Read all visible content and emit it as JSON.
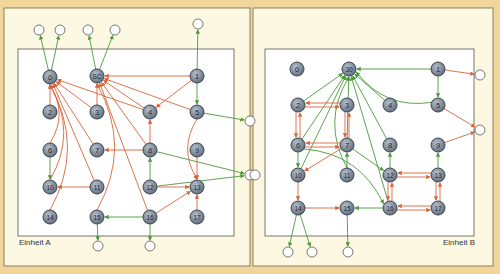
{
  "colors": {
    "background": "#f2d59a",
    "panel": "#fdf8e1",
    "inner": "#ffffff",
    "node_fill": "#7f8c99",
    "node_stroke": "#3c4654",
    "red_edge": "#d9643a",
    "green_edge": "#4b9a3c"
  },
  "panels": [
    {
      "id": "A",
      "label": "Einheit A",
      "outer": [
        4,
        8,
        246,
        258
      ],
      "inner": [
        18,
        49,
        216,
        187
      ],
      "label_pos": [
        19,
        243
      ],
      "nodes": [
        {
          "id": "0",
          "x": 50,
          "y": 77
        },
        {
          "id": "SC",
          "x": 97,
          "y": 76
        },
        {
          "id": "1",
          "x": 197,
          "y": 76
        },
        {
          "id": "2",
          "x": 50,
          "y": 112
        },
        {
          "id": "3",
          "x": 97,
          "y": 112
        },
        {
          "id": "4",
          "x": 150,
          "y": 112
        },
        {
          "id": "5",
          "x": 197,
          "y": 112
        },
        {
          "id": "6",
          "x": 50,
          "y": 150
        },
        {
          "id": "7",
          "x": 97,
          "y": 150
        },
        {
          "id": "8",
          "x": 150,
          "y": 150
        },
        {
          "id": "9",
          "x": 197,
          "y": 150
        },
        {
          "id": "10",
          "x": 50,
          "y": 187
        },
        {
          "id": "11",
          "x": 97,
          "y": 187
        },
        {
          "id": "12",
          "x": 150,
          "y": 187
        },
        {
          "id": "13",
          "x": 197,
          "y": 187
        },
        {
          "id": "14",
          "x": 50,
          "y": 217
        },
        {
          "id": "15",
          "x": 97,
          "y": 217
        },
        {
          "id": "16",
          "x": 150,
          "y": 217
        },
        {
          "id": "17",
          "x": 197,
          "y": 217
        }
      ],
      "externals": [
        {
          "id": "eA1",
          "x": 39,
          "y": 30
        },
        {
          "id": "eA2",
          "x": 60,
          "y": 30
        },
        {
          "id": "eA3",
          "x": 88,
          "y": 30
        },
        {
          "id": "eA4",
          "x": 115,
          "y": 30
        },
        {
          "id": "eA5",
          "x": 198,
          "y": 24
        },
        {
          "id": "eA6",
          "x": 250,
          "y": 121
        },
        {
          "id": "eA7",
          "x": 250,
          "y": 175
        },
        {
          "id": "eA8",
          "x": 98,
          "y": 246
        },
        {
          "id": "eA9",
          "x": 150,
          "y": 246
        }
      ],
      "edges": [
        {
          "from": "0",
          "to": "eA1",
          "color": "green"
        },
        {
          "from": "0",
          "to": "eA2",
          "color": "green"
        },
        {
          "from": "SC",
          "to": "eA3",
          "color": "green"
        },
        {
          "from": "SC",
          "to": "eA4",
          "color": "green"
        },
        {
          "from": "1",
          "to": "eA5",
          "color": "green"
        },
        {
          "from": "1",
          "to": "5",
          "color": "green"
        },
        {
          "from": "5",
          "to": "eA6",
          "color": "green"
        },
        {
          "from": "8",
          "to": "eA7",
          "color": "green"
        },
        {
          "from": "12",
          "to": "eA7",
          "color": "green"
        },
        {
          "from": "12",
          "to": "8",
          "color": "green"
        },
        {
          "from": "6",
          "to": "10",
          "color": "green"
        },
        {
          "from": "16",
          "to": "15",
          "color": "green"
        },
        {
          "from": "15",
          "to": "eA8",
          "color": "green"
        },
        {
          "from": "16",
          "to": "eA9",
          "color": "green"
        },
        {
          "from": "1",
          "to": "SC",
          "color": "red"
        },
        {
          "from": "1",
          "to": "4",
          "color": "red"
        },
        {
          "from": "2",
          "to": "0",
          "color": "red"
        },
        {
          "from": "3",
          "to": "0",
          "color": "red"
        },
        {
          "from": "3",
          "to": "SC",
          "color": "red"
        },
        {
          "from": "4",
          "to": "0",
          "color": "red"
        },
        {
          "from": "4",
          "to": "SC",
          "color": "red"
        },
        {
          "from": "5",
          "to": "SC",
          "color": "red"
        },
        {
          "from": "7",
          "to": "0",
          "color": "red"
        },
        {
          "from": "11",
          "to": "0",
          "color": "red"
        },
        {
          "from": "10",
          "to": "0",
          "color": "red",
          "curve": true
        },
        {
          "from": "14",
          "to": "0",
          "color": "red",
          "curve": true
        },
        {
          "from": "6",
          "to": "0",
          "color": "red",
          "curve": true
        },
        {
          "from": "15",
          "to": "SC",
          "color": "red",
          "curve": true
        },
        {
          "from": "16",
          "to": "SC",
          "color": "red"
        },
        {
          "from": "8",
          "to": "SC",
          "color": "red"
        },
        {
          "from": "8",
          "to": "7",
          "color": "red"
        },
        {
          "from": "8",
          "to": "4",
          "color": "red"
        },
        {
          "from": "11",
          "to": "10",
          "color": "red"
        },
        {
          "from": "9",
          "to": "13",
          "color": "red"
        },
        {
          "from": "12",
          "to": "13",
          "color": "red"
        },
        {
          "from": "16",
          "to": "13",
          "color": "red"
        },
        {
          "from": "17",
          "to": "13",
          "color": "red"
        },
        {
          "from": "5",
          "to": "13",
          "color": "red",
          "curve": true
        }
      ]
    },
    {
      "id": "B",
      "label": "Einheit B",
      "outer": [
        253,
        8,
        240,
        258
      ],
      "inner": [
        265,
        49,
        209,
        187
      ],
      "label_pos": [
        443,
        243
      ],
      "nodes": [
        {
          "id": "0",
          "x": 297,
          "y": 69
        },
        {
          "id": "30",
          "x": 349,
          "y": 69
        },
        {
          "id": "1",
          "x": 438,
          "y": 69
        },
        {
          "id": "2",
          "x": 298,
          "y": 105
        },
        {
          "id": "3",
          "x": 347,
          "y": 105
        },
        {
          "id": "4",
          "x": 390,
          "y": 105
        },
        {
          "id": "5",
          "x": 438,
          "y": 105
        },
        {
          "id": "6",
          "x": 298,
          "y": 145
        },
        {
          "id": "7",
          "x": 347,
          "y": 145
        },
        {
          "id": "8",
          "x": 390,
          "y": 145
        },
        {
          "id": "9",
          "x": 438,
          "y": 145
        },
        {
          "id": "10",
          "x": 298,
          "y": 175
        },
        {
          "id": "11",
          "x": 347,
          "y": 175
        },
        {
          "id": "12",
          "x": 390,
          "y": 175
        },
        {
          "id": "13",
          "x": 438,
          "y": 175
        },
        {
          "id": "14",
          "x": 298,
          "y": 208
        },
        {
          "id": "15",
          "x": 347,
          "y": 208
        },
        {
          "id": "16",
          "x": 390,
          "y": 208
        },
        {
          "id": "17",
          "x": 438,
          "y": 208
        }
      ],
      "externals": [
        {
          "id": "eB1",
          "x": 480,
          "y": 75
        },
        {
          "id": "eB2",
          "x": 480,
          "y": 130
        },
        {
          "id": "eB3",
          "x": 255,
          "y": 175
        },
        {
          "id": "eB4",
          "x": 288,
          "y": 252
        },
        {
          "id": "eB5",
          "x": 312,
          "y": 252
        },
        {
          "id": "eB6",
          "x": 348,
          "y": 252
        }
      ],
      "edges": [
        {
          "from": "1",
          "to": "30",
          "color": "green"
        },
        {
          "from": "1",
          "to": "5",
          "color": "green"
        },
        {
          "from": "5",
          "to": "30",
          "color": "green",
          "curve": true
        },
        {
          "from": "2",
          "to": "30",
          "color": "green"
        },
        {
          "from": "4",
          "to": "30",
          "color": "green"
        },
        {
          "from": "8",
          "to": "30",
          "color": "green"
        },
        {
          "from": "6",
          "to": "30",
          "color": "green"
        },
        {
          "from": "10",
          "to": "30",
          "color": "green"
        },
        {
          "from": "7",
          "to": "30",
          "color": "green"
        },
        {
          "from": "11",
          "to": "30",
          "color": "green",
          "curve": true
        },
        {
          "from": "16",
          "to": "30",
          "color": "green"
        },
        {
          "from": "11",
          "to": "7",
          "color": "green"
        },
        {
          "from": "7",
          "to": "12",
          "color": "green"
        },
        {
          "from": "6",
          "to": "10",
          "color": "green"
        },
        {
          "from": "6",
          "to": "16",
          "color": "green",
          "curve": true
        },
        {
          "from": "12",
          "to": "8",
          "color": "green"
        },
        {
          "from": "13",
          "to": "9",
          "color": "green"
        },
        {
          "from": "16",
          "to": "15",
          "color": "green"
        },
        {
          "from": "14",
          "to": "eB4",
          "color": "green"
        },
        {
          "from": "14",
          "to": "eB5",
          "color": "green"
        },
        {
          "from": "15",
          "to": "eB6",
          "color": "green"
        },
        {
          "from": "1",
          "to": "eB1",
          "color": "red"
        },
        {
          "from": "5",
          "to": "eB2",
          "color": "red"
        },
        {
          "from": "9",
          "to": "eB2",
          "color": "red"
        },
        {
          "from": "2",
          "to": "3",
          "color": "red"
        },
        {
          "from": "3",
          "to": "2",
          "color": "red"
        },
        {
          "from": "2",
          "to": "6",
          "color": "red"
        },
        {
          "from": "6",
          "to": "2",
          "color": "red"
        },
        {
          "from": "3",
          "to": "7",
          "color": "red"
        },
        {
          "from": "7",
          "to": "3",
          "color": "red"
        },
        {
          "from": "6",
          "to": "7",
          "color": "red"
        },
        {
          "from": "7",
          "to": "6",
          "color": "red"
        },
        {
          "from": "7",
          "to": "10",
          "color": "red"
        },
        {
          "from": "10",
          "to": "14",
          "color": "red"
        },
        {
          "from": "14",
          "to": "15",
          "color": "red"
        },
        {
          "from": "12",
          "to": "13",
          "color": "red"
        },
        {
          "from": "13",
          "to": "12",
          "color": "red"
        },
        {
          "from": "12",
          "to": "16",
          "color": "red"
        },
        {
          "from": "16",
          "to": "12",
          "color": "red"
        },
        {
          "from": "13",
          "to": "17",
          "color": "red"
        },
        {
          "from": "17",
          "to": "13",
          "color": "red"
        },
        {
          "from": "16",
          "to": "17",
          "color": "red"
        },
        {
          "from": "17",
          "to": "16",
          "color": "red"
        }
      ]
    }
  ]
}
